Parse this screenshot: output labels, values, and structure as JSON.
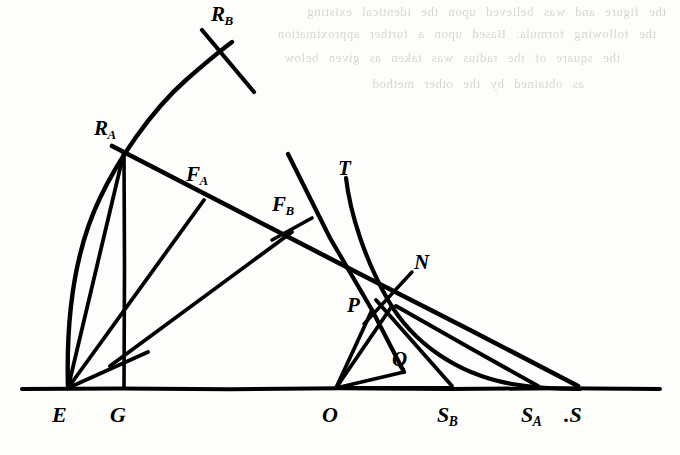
{
  "figure": {
    "kind": "hand-drawn geometric construction diagram",
    "background_color": "#fdfdfb",
    "ink_color": "#000000",
    "baseline_label_row_y": 420,
    "bleed_through": {
      "description": "faint mirrored show-through text from the reverse side of the scanned page",
      "opacity": 0.16,
      "lines": [
        "the figure and was believed upon the identical existing",
        "the following formula. Based upon a further approximation",
        "the square of the radius was taken as given below",
        "as obtained by the other method"
      ]
    },
    "labels": [
      {
        "id": "R_B",
        "text": "R",
        "sub": "B",
        "x": 211,
        "y": 4,
        "size": 21
      },
      {
        "id": "R_A",
        "text": "R",
        "sub": "A",
        "x": 94,
        "y": 118,
        "size": 21
      },
      {
        "id": "F_A",
        "text": "F",
        "sub": "A",
        "x": 186,
        "y": 164,
        "size": 21
      },
      {
        "id": "F_B",
        "text": "F",
        "sub": "B",
        "x": 272,
        "y": 194,
        "size": 21
      },
      {
        "id": "T",
        "text": "T",
        "sub": "",
        "x": 338,
        "y": 158,
        "size": 21
      },
      {
        "id": "N",
        "text": "N",
        "sub": "",
        "x": 414,
        "y": 252,
        "size": 21
      },
      {
        "id": "P",
        "text": "P",
        "sub": "",
        "x": 347,
        "y": 295,
        "size": 21
      },
      {
        "id": "Q",
        "text": "Q",
        "sub": "",
        "x": 392,
        "y": 349,
        "size": 21
      },
      {
        "id": "E",
        "text": "E",
        "sub": "",
        "x": 52,
        "y": 404,
        "size": 22
      },
      {
        "id": "G",
        "text": "G",
        "sub": "",
        "x": 110,
        "y": 404,
        "size": 22
      },
      {
        "id": "O",
        "text": "O",
        "sub": "",
        "x": 322,
        "y": 404,
        "size": 22
      },
      {
        "id": "S_B",
        "text": "S",
        "sub": "B",
        "x": 437,
        "y": 404,
        "size": 22
      },
      {
        "id": "S_A",
        "text": "S",
        "sub": "A",
        "x": 521,
        "y": 404,
        "size": 22
      },
      {
        "id": "S",
        "text": ".S",
        "sub": "",
        "x": 564,
        "y": 404,
        "size": 22
      }
    ],
    "points": {
      "E": {
        "x": 68,
        "y": 388
      },
      "G": {
        "x": 124,
        "y": 388
      },
      "O": {
        "x": 336,
        "y": 388
      },
      "S_B": {
        "x": 450,
        "y": 388
      },
      "S_A": {
        "x": 539,
        "y": 388
      },
      "S": {
        "x": 578,
        "y": 388
      },
      "R_A": {
        "x": 124,
        "y": 152
      },
      "R_B": {
        "x": 228,
        "y": 44
      },
      "F_A": {
        "x": 200,
        "y": 196
      },
      "F_B": {
        "x": 300,
        "y": 222
      },
      "P": {
        "x": 375,
        "y": 312
      },
      "N": {
        "x": 393,
        "y": 305
      },
      "Q": {
        "x": 393,
        "y": 305
      }
    },
    "strokes": [
      {
        "name": "baseline",
        "width": 4.0
      },
      {
        "name": "arc-E-RA-RB",
        "width": 4.2
      },
      {
        "name": "cross-stroke-at-RB",
        "width": 4.2
      },
      {
        "name": "line-G-RA-vertical",
        "width": 3.6
      },
      {
        "name": "line-RA-to-S",
        "width": 4.4
      },
      {
        "name": "line-E-to-FA",
        "width": 4.0
      },
      {
        "name": "line-E-to-FB",
        "width": 4.0
      },
      {
        "name": "line-FA-down-to-E",
        "width": 3.6
      },
      {
        "name": "line-FB-down",
        "width": 3.6
      },
      {
        "name": "line-T-curve",
        "width": 3.8
      },
      {
        "name": "line-FB-through-N",
        "width": 4.2
      },
      {
        "name": "line-O-to-P",
        "width": 3.8
      },
      {
        "name": "line-O-to-N",
        "width": 3.8
      },
      {
        "name": "line-O-to-SB",
        "width": 3.8
      },
      {
        "name": "curve-T-to-S",
        "width": 4.2
      },
      {
        "name": "line-N-tick",
        "width": 3.4
      }
    ]
  }
}
